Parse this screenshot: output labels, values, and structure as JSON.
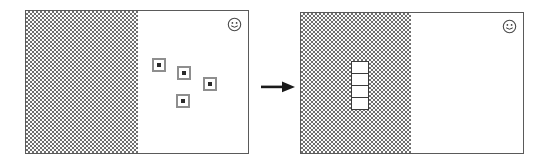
{
  "figure": {
    "title": "Scattered items collected into an ordered stack",
    "transition_symbol": "→"
  },
  "panels": [
    {
      "id": "before",
      "label": "Before",
      "frame": {
        "x": 25,
        "y": 10,
        "width": 224,
        "height": 144
      },
      "regions": [
        {
          "name": "hatched-region",
          "fill": "#6f6f6f",
          "pattern": "checkerboard-dither-50",
          "x": 0,
          "y": 0,
          "width": 112,
          "height": 142
        },
        {
          "name": "white-region",
          "fill": "#ffffff",
          "x": 112,
          "y": 0,
          "width": 110,
          "height": 142
        }
      ],
      "badge": {
        "name": "smiley-icon",
        "glyph": "☺",
        "x": 203,
        "y": 7
      },
      "markers": [
        {
          "name": "marker-1",
          "x": 126,
          "y": 47
        },
        {
          "name": "marker-2",
          "x": 151,
          "y": 55
        },
        {
          "name": "marker-3",
          "x": 177,
          "y": 66
        },
        {
          "name": "marker-4",
          "x": 150,
          "y": 83
        }
      ],
      "marker_style": {
        "outer": "#8e8e8e",
        "ring": "#ffffff",
        "center": "#2b2b2b",
        "size": 14
      },
      "stack": null
    },
    {
      "id": "after",
      "label": "After",
      "frame": {
        "x": 300,
        "y": 12,
        "width": 224,
        "height": 142
      },
      "regions": [
        {
          "name": "hatched-region",
          "fill": "#6f6f6f",
          "pattern": "checkerboard-dither-50",
          "x": 0,
          "y": 0,
          "width": 110,
          "height": 140
        },
        {
          "name": "white-region",
          "fill": "#ffffff",
          "x": 110,
          "y": 0,
          "width": 112,
          "height": 140
        }
      ],
      "badge": {
        "name": "smiley-icon",
        "glyph": "☺",
        "x": 203,
        "y": 7
      },
      "markers": [],
      "stack": {
        "name": "cell-stack",
        "x": 50,
        "y": 48,
        "cell_width": 18,
        "cell_height": 13,
        "cell_fill": "#ffffff",
        "cell_border": "#3a3a3a",
        "cells": [
          {
            "name": "stack-cell-1",
            "value": ""
          },
          {
            "name": "stack-cell-2",
            "value": ""
          },
          {
            "name": "stack-cell-3",
            "value": ""
          },
          {
            "name": "stack-cell-4",
            "value": ""
          }
        ]
      }
    }
  ],
  "arrow": {
    "name": "transition-arrow",
    "direction": "right",
    "color": "#1a1a1a",
    "x": 261,
    "y": 79,
    "width": 34,
    "height": 12
  },
  "colors": {
    "border": "#5a5a5a",
    "hatch": "#6f6f6f",
    "marker_outer": "#8e8e8e",
    "marker_center": "#2b2b2b",
    "cell_border": "#3a3a3a",
    "arrow": "#1a1a1a",
    "background": "#ffffff"
  }
}
